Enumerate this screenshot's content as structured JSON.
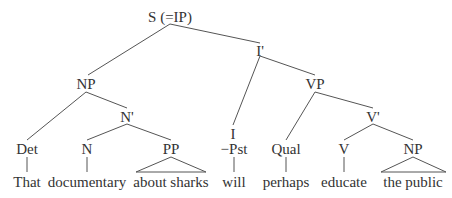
{
  "tree": {
    "nodes": [
      {
        "id": "S",
        "label": "S (=IP)",
        "x": 170,
        "y": 9
      },
      {
        "id": "Ibar",
        "label": "I'",
        "x": 260,
        "y": 43
      },
      {
        "id": "NP1",
        "label": "NP",
        "x": 86,
        "y": 76
      },
      {
        "id": "VP",
        "label": "VP",
        "x": 315,
        "y": 76
      },
      {
        "id": "Nbar",
        "label": "N'",
        "x": 127,
        "y": 109
      },
      {
        "id": "Vbar",
        "label": "V'",
        "x": 373,
        "y": 109
      },
      {
        "id": "Det",
        "label": "Det",
        "x": 27,
        "y": 141
      },
      {
        "id": "N",
        "label": "N",
        "x": 87,
        "y": 141
      },
      {
        "id": "PP",
        "label": "PP",
        "x": 171,
        "y": 141
      },
      {
        "id": "I",
        "label": "I",
        "x": 233,
        "y": 126
      },
      {
        "id": "Pst",
        "label": "−Pst",
        "x": 234,
        "y": 141
      },
      {
        "id": "Qual",
        "label": "Qual",
        "x": 286,
        "y": 141
      },
      {
        "id": "V",
        "label": "V",
        "x": 344,
        "y": 141
      },
      {
        "id": "NP2",
        "label": "NP",
        "x": 413,
        "y": 141
      }
    ],
    "words": [
      {
        "id": "w1",
        "text": "That",
        "x": 27,
        "y": 174
      },
      {
        "id": "w2",
        "text": "documentary",
        "x": 87,
        "y": 174
      },
      {
        "id": "w3",
        "text": "about sharks",
        "x": 171,
        "y": 174
      },
      {
        "id": "w4",
        "text": "will",
        "x": 234,
        "y": 174
      },
      {
        "id": "w5",
        "text": "perhaps",
        "x": 286,
        "y": 174
      },
      {
        "id": "w6",
        "text": "educate",
        "x": 344,
        "y": 174
      },
      {
        "id": "w7",
        "text": "the public",
        "x": 413,
        "y": 174
      }
    ],
    "edges": [
      [
        170,
        24,
        88,
        75
      ],
      [
        170,
        24,
        260,
        43
      ],
      [
        86,
        92,
        27,
        140
      ],
      [
        86,
        92,
        127,
        108
      ],
      [
        260,
        56,
        233,
        125
      ],
      [
        260,
        56,
        315,
        75
      ],
      [
        127,
        124,
        87,
        140
      ],
      [
        127,
        124,
        171,
        140
      ],
      [
        315,
        92,
        286,
        140
      ],
      [
        315,
        92,
        373,
        108
      ],
      [
        373,
        124,
        344,
        140
      ],
      [
        373,
        124,
        413,
        140
      ],
      [
        27,
        157,
        27,
        172
      ],
      [
        87,
        157,
        87,
        172
      ],
      [
        234,
        157,
        234,
        172
      ],
      [
        286,
        157,
        286,
        172
      ],
      [
        344,
        157,
        344,
        172
      ]
    ],
    "triangles": [
      [
        171,
        157,
        136,
        172,
        206,
        172
      ],
      [
        413,
        157,
        381,
        172,
        446,
        172
      ]
    ],
    "line_color": "#555555"
  }
}
